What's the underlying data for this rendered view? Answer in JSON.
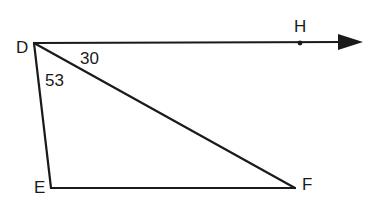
{
  "diagram": {
    "type": "geometry-triangle-with-ray",
    "points": {
      "D": {
        "label": "D",
        "x": 34,
        "y": 43
      },
      "E": {
        "label": "E",
        "x": 51,
        "y": 188
      },
      "F": {
        "label": "F",
        "x": 295,
        "y": 188
      },
      "H": {
        "label": "H",
        "x": 300,
        "y": 43
      }
    },
    "ray": {
      "from": "D",
      "through": "H",
      "arrow_tip": {
        "x": 363,
        "y": 42
      }
    },
    "segments": [
      [
        "D",
        "E"
      ],
      [
        "E",
        "F"
      ],
      [
        "D",
        "F"
      ]
    ],
    "angles": [
      {
        "between": [
          "DH",
          "DF"
        ],
        "value": "30"
      },
      {
        "between": [
          "DF",
          "DE"
        ],
        "value": "53"
      }
    ],
    "line_color": "#1a1a1a"
  }
}
